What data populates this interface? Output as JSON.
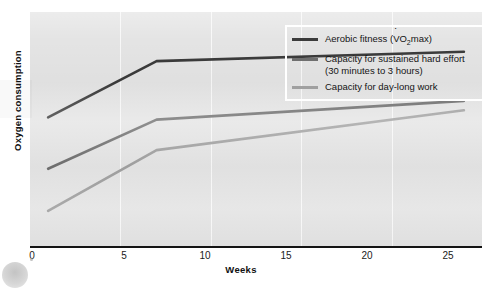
{
  "chart_data": {
    "type": "line",
    "title": "",
    "xlabel": "Weeks",
    "ylabel": "Oxygen consumption",
    "xlim": [
      0,
      25
    ],
    "ylim": [
      0,
      100
    ],
    "xticks": [
      0,
      5,
      10,
      15,
      20,
      25
    ],
    "yticks": [],
    "grid": "vertical-only",
    "legend_position": "top-right",
    "series": [
      {
        "name": "Aerobic fitness (VO2max)",
        "color": "#3b3b3b",
        "x": [
          1,
          7,
          24
        ],
        "values": [
          55,
          79,
          83
        ]
      },
      {
        "name": "Capacity for sustained hard effort (30 minutes to 3 hours)",
        "color": "#6f6f6f",
        "x": [
          1,
          7,
          24
        ],
        "values": [
          33,
          54,
          62
        ]
      },
      {
        "name": "Capacity for day-long work",
        "color": "#a0a0a0",
        "x": [
          1,
          7,
          24
        ],
        "values": [
          15,
          41,
          58
        ]
      }
    ]
  },
  "axes": {
    "x_title": "Weeks",
    "y_title": "Oxygen consumption",
    "x_tick_labels": [
      "0",
      "5",
      "10",
      "15",
      "20",
      "25"
    ]
  },
  "legend": {
    "items": [
      {
        "label_prefix": "Aerobic fitness (",
        "label_v": "V",
        "label_o": "O",
        "label_sub": "2",
        "label_suffix": "max)",
        "color": "#3b3b3b"
      },
      {
        "line1": "Capacity for sustained hard effort",
        "line2": "(30 minutes to 3 hours)",
        "color": "#6f6f6f"
      },
      {
        "line1": "Capacity for day-long work",
        "line2": "",
        "color": "#a0a0a0"
      }
    ]
  },
  "colors": {
    "plot_background": "#e4e4e4",
    "page_background": "#ffffff",
    "axis": "#141414",
    "gridline": "#ffffff",
    "series_dark": "#3b3b3b",
    "series_medium": "#6f6f6f",
    "series_light": "#a0a0a0"
  }
}
